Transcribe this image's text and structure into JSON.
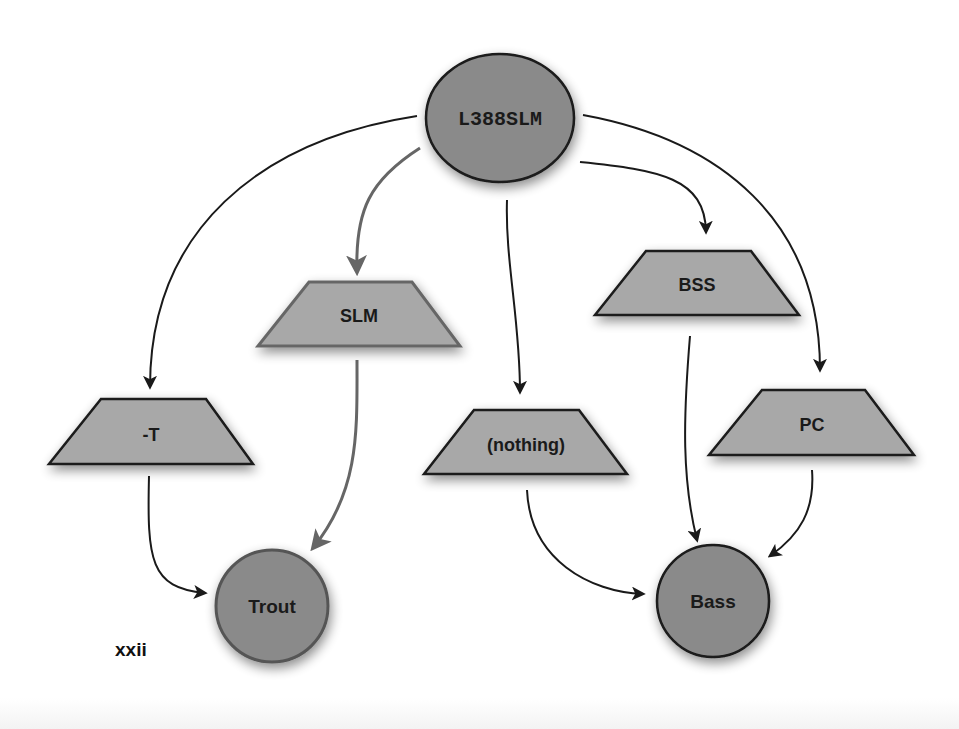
{
  "diagram": {
    "type": "flow",
    "colors": {
      "node_fill": "#8a8a8a",
      "trapezoid_fill": "#a8a8a8",
      "stroke_dark": "#1a1a1a",
      "stroke_gray": "#666666",
      "background": "#ffffff"
    },
    "source_node": {
      "label": "L388SLM",
      "shape": "ellipse"
    },
    "filters": [
      {
        "label": "-T",
        "shape": "trapezoid"
      },
      {
        "label": "SLM",
        "shape": "trapezoid"
      },
      {
        "label": "(nothing)",
        "shape": "trapezoid"
      },
      {
        "label": "BSS",
        "shape": "trapezoid"
      },
      {
        "label": "PC",
        "shape": "trapezoid"
      }
    ],
    "targets": [
      {
        "label": "Trout",
        "shape": "circle"
      },
      {
        "label": "Bass",
        "shape": "circle"
      }
    ],
    "edges": [
      {
        "from": "L388SLM",
        "to": "-T"
      },
      {
        "from": "L388SLM",
        "to": "SLM"
      },
      {
        "from": "L388SLM",
        "to": "(nothing)"
      },
      {
        "from": "L388SLM",
        "to": "BSS"
      },
      {
        "from": "L388SLM",
        "to": "PC"
      },
      {
        "from": "-T",
        "to": "Trout"
      },
      {
        "from": "SLM",
        "to": "Trout"
      },
      {
        "from": "(nothing)",
        "to": "Bass"
      },
      {
        "from": "BSS",
        "to": "Bass"
      },
      {
        "from": "PC",
        "to": "Bass"
      }
    ]
  },
  "page": {
    "number": "xxii"
  }
}
